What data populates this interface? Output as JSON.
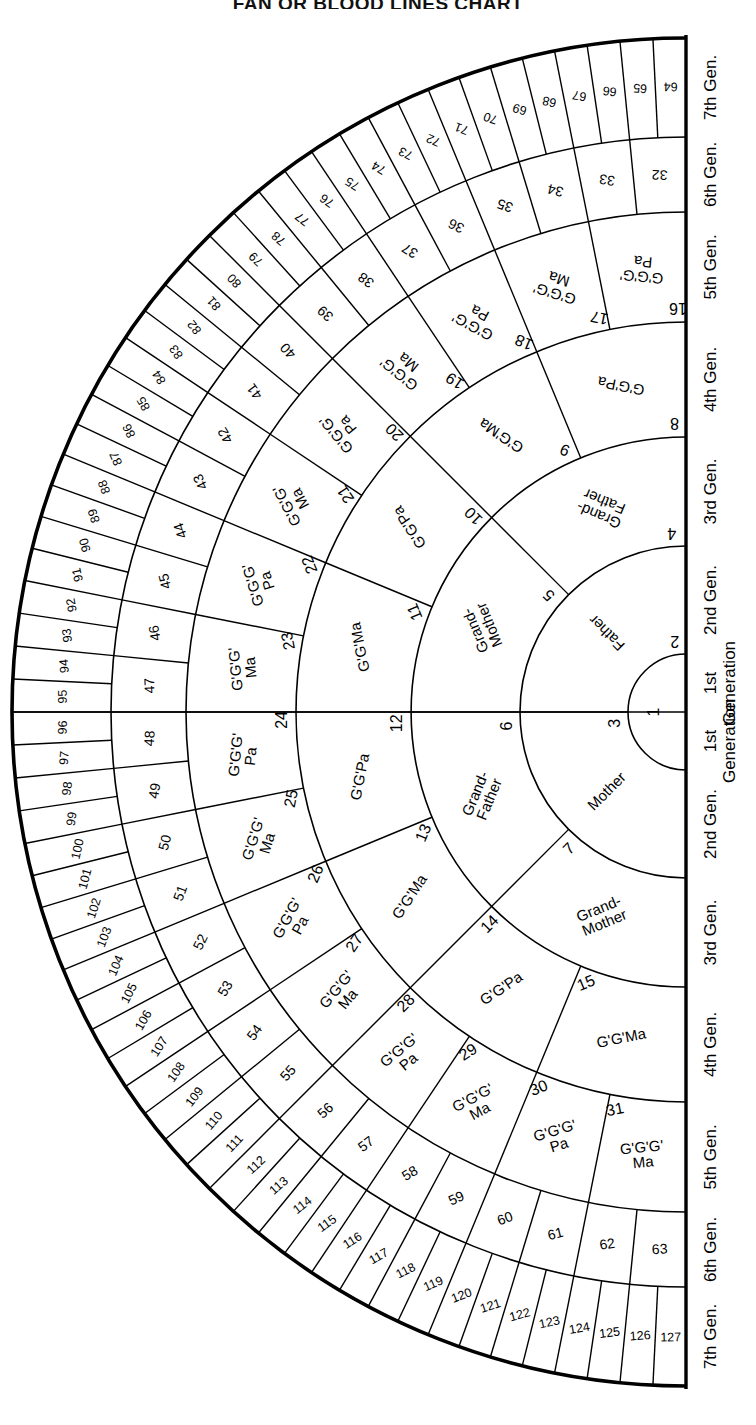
{
  "title": "FAN OR BLOOD LINES CHART",
  "chart_data": {
    "type": "pie",
    "title": "FAN OR BLOOD LINES CHART",
    "subtitle": "Ahnentafel fan / pedigree chart, 7 generations, 127 ancestor positions",
    "orientation": "center at right edge, fan opens to the left, 180 degree sweep",
    "grid": false,
    "legend_position": "right-edge vertical labels",
    "generation_labels_top": [
      "1st Generation",
      "2nd Gen.",
      "3rd Gen.",
      "4th Gen.",
      "5th Gen.",
      "6th Gen.",
      "7th Gen."
    ],
    "generation_labels_bottom": [
      "1st Generation",
      "2nd Gen.",
      "3rd Gen.",
      "4th Gen.",
      "5th Gen.",
      "6th Gen.",
      "7th Gen."
    ],
    "ring_counts": [
      1,
      2,
      4,
      8,
      16,
      32,
      64
    ],
    "ring_radii": [
      58,
      166,
      275,
      390,
      500,
      575,
      674
    ],
    "rings": [
      {
        "generation": 1,
        "label": "1st Generation",
        "cells": [
          {
            "num": "1",
            "text": ""
          }
        ]
      },
      {
        "generation": 2,
        "label": "2nd Gen.",
        "cells": [
          {
            "num": "2",
            "text": "Father"
          },
          {
            "num": "3",
            "text": "Mother"
          }
        ]
      },
      {
        "generation": 3,
        "label": "3rd Gen.",
        "cells": [
          {
            "num": "4",
            "text": "Grand-\nFather"
          },
          {
            "num": "5",
            "text": "Grand-\nMother"
          },
          {
            "num": "6",
            "text": "Grand-\nFather"
          },
          {
            "num": "7",
            "text": "Grand-\nMother"
          }
        ]
      },
      {
        "generation": 4,
        "label": "4th Gen.",
        "cells": [
          {
            "num": "8",
            "text": "G'G'Pa"
          },
          {
            "num": "9",
            "text": "G'G'Ma"
          },
          {
            "num": "10",
            "text": "G'G'Pa"
          },
          {
            "num": "11",
            "text": "G'G'Ma"
          },
          {
            "num": "12",
            "text": "G'G'Pa"
          },
          {
            "num": "13",
            "text": "G'G'Ma"
          },
          {
            "num": "14",
            "text": "G'G'Pa"
          },
          {
            "num": "15",
            "text": "G'G'Ma"
          }
        ]
      },
      {
        "generation": 5,
        "label": "5th Gen.",
        "cells": [
          {
            "num": "16",
            "text": "G'G'G'\nPa"
          },
          {
            "num": "17",
            "text": "G'G'G'\nMa"
          },
          {
            "num": "18",
            "text": "G'G'G'\nPa"
          },
          {
            "num": "19",
            "text": "G'G'G'\nMa"
          },
          {
            "num": "20",
            "text": "G'G'G'\nPa"
          },
          {
            "num": "21",
            "text": "G'G'G'\nMa"
          },
          {
            "num": "22",
            "text": "G'G'G'\nPa"
          },
          {
            "num": "23",
            "text": "G'G'G'\nMa"
          },
          {
            "num": "24",
            "text": "G'G'G'\nPa"
          },
          {
            "num": "25",
            "text": "G'G'G'\nMa"
          },
          {
            "num": "26",
            "text": "G'G'G'\nPa"
          },
          {
            "num": "27",
            "text": "G'G'G'\nMa"
          },
          {
            "num": "28",
            "text": "G'G'G'\nPa"
          },
          {
            "num": "29",
            "text": "G'G'G'\nMa"
          },
          {
            "num": "30",
            "text": "G'G'G'\nPa"
          },
          {
            "num": "31",
            "text": "G'G'G'\nMa"
          }
        ]
      },
      {
        "generation": 6,
        "label": "6th Gen.",
        "cells": [
          {
            "num": "32"
          },
          {
            "num": "33"
          },
          {
            "num": "34"
          },
          {
            "num": "35"
          },
          {
            "num": "36"
          },
          {
            "num": "37"
          },
          {
            "num": "38"
          },
          {
            "num": "39"
          },
          {
            "num": "40"
          },
          {
            "num": "41"
          },
          {
            "num": "42"
          },
          {
            "num": "43"
          },
          {
            "num": "44"
          },
          {
            "num": "45"
          },
          {
            "num": "46"
          },
          {
            "num": "47"
          },
          {
            "num": "48"
          },
          {
            "num": "49"
          },
          {
            "num": "50"
          },
          {
            "num": "51"
          },
          {
            "num": "52"
          },
          {
            "num": "53"
          },
          {
            "num": "54"
          },
          {
            "num": "55"
          },
          {
            "num": "56"
          },
          {
            "num": "57"
          },
          {
            "num": "58"
          },
          {
            "num": "59"
          },
          {
            "num": "60"
          },
          {
            "num": "61"
          },
          {
            "num": "62"
          },
          {
            "num": "63"
          }
        ]
      },
      {
        "generation": 7,
        "label": "7th Gen.",
        "cells": [
          {
            "num": "64"
          },
          {
            "num": "65"
          },
          {
            "num": "66"
          },
          {
            "num": "67"
          },
          {
            "num": "68"
          },
          {
            "num": "69"
          },
          {
            "num": "70"
          },
          {
            "num": "71"
          },
          {
            "num": "72"
          },
          {
            "num": "73"
          },
          {
            "num": "74"
          },
          {
            "num": "75"
          },
          {
            "num": "76"
          },
          {
            "num": "77"
          },
          {
            "num": "78"
          },
          {
            "num": "79"
          },
          {
            "num": "80"
          },
          {
            "num": "81"
          },
          {
            "num": "82"
          },
          {
            "num": "83"
          },
          {
            "num": "84"
          },
          {
            "num": "85"
          },
          {
            "num": "86"
          },
          {
            "num": "87"
          },
          {
            "num": "88"
          },
          {
            "num": "89"
          },
          {
            "num": "90"
          },
          {
            "num": "91"
          },
          {
            "num": "92"
          },
          {
            "num": "93"
          },
          {
            "num": "94"
          },
          {
            "num": "95"
          },
          {
            "num": "96"
          },
          {
            "num": "97"
          },
          {
            "num": "98"
          },
          {
            "num": "99"
          },
          {
            "num": "100"
          },
          {
            "num": "101"
          },
          {
            "num": "102"
          },
          {
            "num": "103"
          },
          {
            "num": "104"
          },
          {
            "num": "105"
          },
          {
            "num": "106"
          },
          {
            "num": "107"
          },
          {
            "num": "108"
          },
          {
            "num": "109"
          },
          {
            "num": "110"
          },
          {
            "num": "111"
          },
          {
            "num": "112"
          },
          {
            "num": "113"
          },
          {
            "num": "114"
          },
          {
            "num": "115"
          },
          {
            "num": "116"
          },
          {
            "num": "117"
          },
          {
            "num": "118"
          },
          {
            "num": "119"
          },
          {
            "num": "120"
          },
          {
            "num": "121"
          },
          {
            "num": "122"
          },
          {
            "num": "123"
          },
          {
            "num": "124"
          },
          {
            "num": "125"
          },
          {
            "num": "126"
          },
          {
            "num": "127"
          }
        ]
      }
    ]
  },
  "axis": {
    "top_labels": [
      {
        "text": "1st",
        "sub": "Generation"
      },
      {
        "text": "2nd Gen."
      },
      {
        "text": "3rd Gen."
      },
      {
        "text": "4th Gen."
      },
      {
        "text": "5th Gen."
      },
      {
        "text": "6th Gen."
      },
      {
        "text": "7th Gen."
      }
    ],
    "bottom_labels": [
      {
        "text": "1st",
        "sub": "Generation"
      },
      {
        "text": "2nd Gen."
      },
      {
        "text": "3rd Gen."
      },
      {
        "text": "4th Gen."
      },
      {
        "text": "5th Gen."
      },
      {
        "text": "6th Gen."
      },
      {
        "text": "7th Gen."
      }
    ]
  },
  "colors": {
    "ink": "#000000",
    "paper": "#ffffff"
  }
}
